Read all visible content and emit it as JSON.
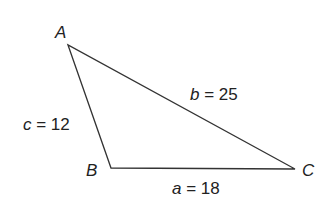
{
  "diagram": {
    "type": "triangle",
    "vertices": [
      {
        "name": "A",
        "x": 68,
        "y": 45
      },
      {
        "name": "B",
        "x": 111,
        "y": 168
      },
      {
        "name": "C",
        "x": 295,
        "y": 169
      }
    ],
    "sides": [
      {
        "var": "a",
        "eq": " = 18",
        "from": "B",
        "to": "C"
      },
      {
        "var": "b",
        "eq": " = 25",
        "from": "A",
        "to": "C"
      },
      {
        "var": "c",
        "eq": " = 12",
        "from": "A",
        "to": "B"
      }
    ],
    "line_color": "#333333"
  }
}
